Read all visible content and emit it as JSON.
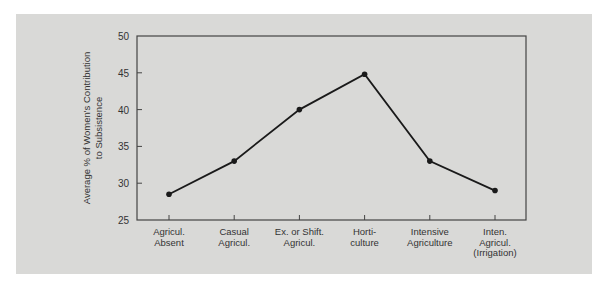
{
  "chart_data": {
    "type": "line",
    "title": "",
    "xlabel": "",
    "ylabel": [
      "Average % of Women's Contribution",
      "to Subsistence"
    ],
    "categories": [
      [
        "Agricul.",
        "Absent"
      ],
      [
        "Casual",
        "Agricul."
      ],
      [
        "Ex. or Shift.",
        "Agricul."
      ],
      [
        "Horti-",
        "culture"
      ],
      [
        "Intensive",
        "Agriculture"
      ],
      [
        "Inten.",
        "Agricul.",
        "(Irrigation)"
      ]
    ],
    "series": [
      {
        "name": "Women's contribution",
        "values": [
          28.5,
          33,
          40,
          44.8,
          33,
          29
        ]
      }
    ],
    "ylim": [
      25,
      50
    ],
    "yticks": [
      25,
      30,
      35,
      40,
      45,
      50
    ],
    "grid": false,
    "legend": "none",
    "colors": {
      "line": "#1a1a1a",
      "frame": "#444444",
      "background": "#d9d9d7"
    }
  }
}
